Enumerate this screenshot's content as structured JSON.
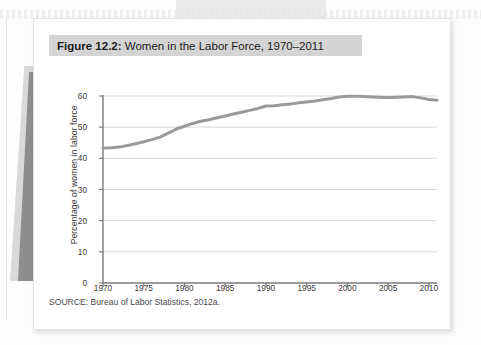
{
  "figure": {
    "number_label": "Figure 12.2:",
    "title_text": " Women in the Labor Force, 1970–2011",
    "source": "SOURCE: Bureau of Labor Statistics, 2012a."
  },
  "colors": {
    "line": "#9a9a9a",
    "axis": "#7a7a7a",
    "grid": "#d9d9d9",
    "title_bar": "#d4d4d4",
    "card": "#ffffff",
    "text": "#1d1d1d"
  },
  "chart_data": {
    "type": "line",
    "title": "Figure 12.2: Women in the Labor Force, 1970–2011",
    "xlabel": "",
    "ylabel": "Percentage of women in labor force",
    "xlim": [
      1970,
      2011
    ],
    "ylim": [
      0,
      60
    ],
    "grid": true,
    "legend": "none",
    "xticks": [
      1970,
      1975,
      1980,
      1985,
      1990,
      1995,
      2000,
      2005,
      2010
    ],
    "yticks": [
      0,
      10,
      20,
      30,
      40,
      50,
      60
    ],
    "series": [
      {
        "name": "Percentage of women in labor force",
        "color": "#9a9a9a",
        "x": [
          1970,
          1971,
          1972,
          1973,
          1974,
          1975,
          1976,
          1977,
          1978,
          1979,
          1980,
          1981,
          1982,
          1983,
          1984,
          1985,
          1986,
          1987,
          1988,
          1989,
          1990,
          1991,
          1992,
          1993,
          1994,
          1995,
          1996,
          1997,
          1998,
          1999,
          2000,
          2001,
          2002,
          2003,
          2004,
          2005,
          2006,
          2007,
          2008,
          2009,
          2010,
          2011
        ],
        "values": [
          43.3,
          43.4,
          43.6,
          44.1,
          44.7,
          45.3,
          46.0,
          46.8,
          48.1,
          49.4,
          50.3,
          51.2,
          51.9,
          52.4,
          53.0,
          53.6,
          54.2,
          54.8,
          55.4,
          56.0,
          56.8,
          56.9,
          57.2,
          57.4,
          57.8,
          58.1,
          58.4,
          58.8,
          59.2,
          59.7,
          59.9,
          59.9,
          59.8,
          59.7,
          59.6,
          59.5,
          59.6,
          59.7,
          59.8,
          59.4,
          58.9,
          58.6
        ]
      }
    ]
  }
}
